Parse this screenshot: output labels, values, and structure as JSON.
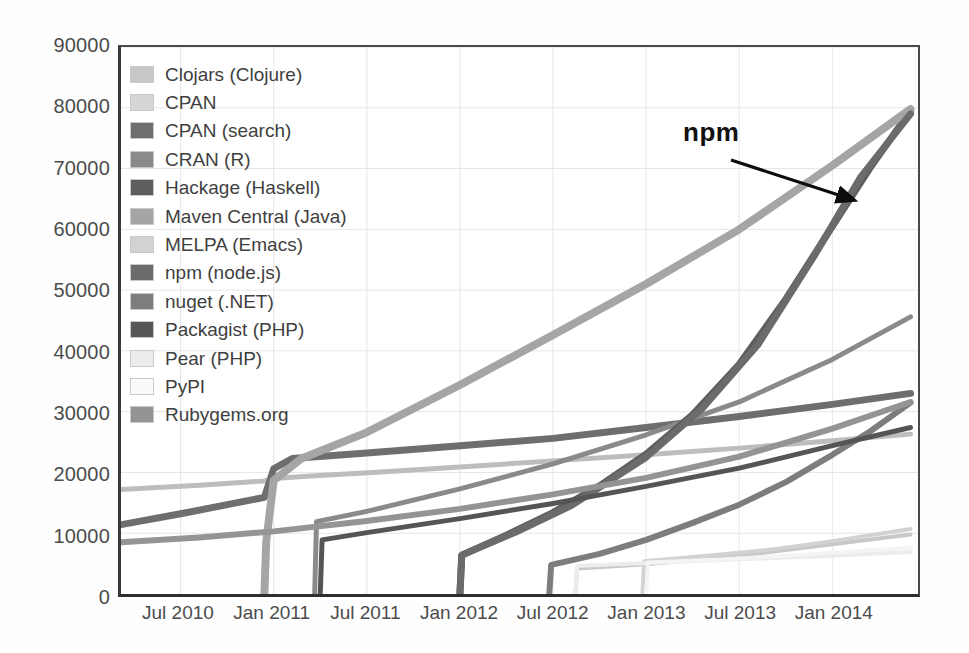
{
  "chart_data": {
    "type": "line",
    "title": "",
    "xlabel": "",
    "ylabel": "",
    "ylim": [
      0,
      90000
    ],
    "ytick_labels": [
      "90000",
      "80000",
      "70000",
      "60000",
      "50000",
      "40000",
      "30000",
      "20000",
      "10000",
      "0"
    ],
    "ytick_values": [
      90000,
      80000,
      70000,
      60000,
      50000,
      40000,
      30000,
      20000,
      10000,
      0
    ],
    "xtick_labels": [
      "Jul 2010",
      "Jan 2011",
      "Jul 2011",
      "Jan 2012",
      "Jul 2012",
      "Jan 2013",
      "Jul 2013",
      "Jan 2014"
    ],
    "xtick_values": [
      2010.5,
      2011.0,
      2011.5,
      2012.0,
      2012.5,
      2013.0,
      2013.5,
      2014.0
    ],
    "xlim": [
      2010.18,
      2014.46
    ],
    "grid": true,
    "grid_color": "#e6e6e6",
    "legend_position": "upper left",
    "annotations": [
      {
        "text": "npm",
        "x": 2013.38,
        "y": 73500,
        "arrow_to_x": 2014.13,
        "arrow_to_y": 65200
      }
    ],
    "series": [
      {
        "name": "Clojars (Clojure)",
        "color": "#c8c8c8",
        "width": 4,
        "points": [
          [
            2012.62,
            0
          ],
          [
            2012.63,
            4200
          ],
          [
            2013.0,
            4900
          ],
          [
            2013.5,
            6300
          ],
          [
            2014.0,
            8200
          ],
          [
            2014.42,
            9800
          ]
        ]
      },
      {
        "name": "CPAN",
        "color": "#bdbdbd",
        "width": 5,
        "points": [
          [
            2010.18,
            17200
          ],
          [
            2010.6,
            17900
          ],
          [
            2010.95,
            18600
          ],
          [
            2011.0,
            19000
          ],
          [
            2011.2,
            19400
          ],
          [
            2011.6,
            20100
          ],
          [
            2012.0,
            20900
          ],
          [
            2012.5,
            21900
          ],
          [
            2013.0,
            22900
          ],
          [
            2013.5,
            24000
          ],
          [
            2014.0,
            25200
          ],
          [
            2014.42,
            26300
          ]
        ]
      },
      {
        "name": "CPAN (search)",
        "color": "#6e6e6e",
        "width": 7,
        "points": [
          [
            2010.18,
            11400
          ],
          [
            2010.5,
            13200
          ],
          [
            2010.95,
            15900
          ],
          [
            2011.0,
            20600
          ],
          [
            2011.1,
            22300
          ],
          [
            2011.5,
            23200
          ],
          [
            2012.0,
            24400
          ],
          [
            2012.5,
            25600
          ],
          [
            2013.0,
            27400
          ],
          [
            2013.5,
            29200
          ],
          [
            2014.0,
            31200
          ],
          [
            2014.42,
            33000
          ]
        ]
      },
      {
        "name": "CRAN (R)",
        "color": "#8a8a8a",
        "width": 5,
        "points": [
          [
            2011.22,
            0
          ],
          [
            2011.23,
            11900
          ],
          [
            2011.5,
            13600
          ],
          [
            2012.0,
            17300
          ],
          [
            2012.5,
            21400
          ],
          [
            2013.0,
            26200
          ],
          [
            2013.5,
            31600
          ],
          [
            2014.0,
            38600
          ],
          [
            2014.42,
            45600
          ]
        ]
      },
      {
        "name": "Hackage (Haskell)",
        "color": "#5e5e5e",
        "width": 7,
        "points": [
          [
            2012.0,
            0
          ],
          [
            2012.01,
            6400
          ],
          [
            2012.25,
            9700
          ],
          [
            2012.5,
            13400
          ],
          [
            2012.75,
            17800
          ],
          [
            2013.0,
            23000
          ],
          [
            2013.25,
            29500
          ],
          [
            2013.5,
            37800
          ],
          [
            2013.75,
            48500
          ],
          [
            2014.0,
            60500
          ],
          [
            2014.2,
            70000
          ],
          [
            2014.42,
            79500
          ]
        ]
      },
      {
        "name": "Maven Central (Java)",
        "color": "#a5a5a5",
        "width": 8,
        "points": [
          [
            2010.95,
            0
          ],
          [
            2010.96,
            8700
          ],
          [
            2011.0,
            18700
          ],
          [
            2011.15,
            22300
          ],
          [
            2011.5,
            26600
          ],
          [
            2012.0,
            34400
          ],
          [
            2012.5,
            42600
          ],
          [
            2013.0,
            51000
          ],
          [
            2013.5,
            60000
          ],
          [
            2014.0,
            70500
          ],
          [
            2014.42,
            79800
          ]
        ]
      },
      {
        "name": "MELPA (Emacs)",
        "color": "#d2d2d2",
        "width": 4,
        "points": [
          [
            2012.98,
            0
          ],
          [
            2012.99,
            5400
          ],
          [
            2013.3,
            6200
          ],
          [
            2013.7,
            7400
          ],
          [
            2014.0,
            8700
          ],
          [
            2014.42,
            10700
          ]
        ]
      },
      {
        "name": "npm (node.js)",
        "color": "#6b6b6b",
        "width": 7,
        "points": [
          [
            2012.0,
            0
          ],
          [
            2012.01,
            6400
          ],
          [
            2012.3,
            10200
          ],
          [
            2012.6,
            14600
          ],
          [
            2013.0,
            22500
          ],
          [
            2013.3,
            30500
          ],
          [
            2013.6,
            41000
          ],
          [
            2013.9,
            55500
          ],
          [
            2014.15,
            68500
          ],
          [
            2014.42,
            79000
          ]
        ]
      },
      {
        "name": "nuget (.NET)",
        "color": "#7d7d7d",
        "width": 6,
        "points": [
          [
            2012.48,
            0
          ],
          [
            2012.49,
            4800
          ],
          [
            2012.75,
            6600
          ],
          [
            2013.0,
            8900
          ],
          [
            2013.25,
            11700
          ],
          [
            2013.5,
            14700
          ],
          [
            2013.75,
            18400
          ],
          [
            2014.0,
            22900
          ],
          [
            2014.2,
            26700
          ],
          [
            2014.42,
            31500
          ]
        ]
      },
      {
        "name": "Packagist (PHP)",
        "color": "#555555",
        "width": 5,
        "points": [
          [
            2011.25,
            0
          ],
          [
            2011.26,
            8900
          ],
          [
            2011.5,
            10100
          ],
          [
            2012.0,
            12400
          ],
          [
            2012.5,
            14900
          ],
          [
            2013.0,
            17700
          ],
          [
            2013.5,
            20700
          ],
          [
            2014.0,
            24400
          ],
          [
            2014.42,
            27400
          ]
        ]
      },
      {
        "name": "Pear (PHP)",
        "color": "#ececec",
        "width": 4,
        "points": [
          [
            2012.62,
            0
          ],
          [
            2012.63,
            4600
          ],
          [
            2013.0,
            5100
          ],
          [
            2013.5,
            5700
          ],
          [
            2014.0,
            6300
          ],
          [
            2014.42,
            6900
          ]
        ]
      },
      {
        "name": "PyPI",
        "color": "#f4f4f4",
        "width": 4,
        "points": [
          [
            2013.0,
            0
          ],
          [
            2013.01,
            5200
          ],
          [
            2013.4,
            5700
          ],
          [
            2013.8,
            6400
          ],
          [
            2014.1,
            7000
          ],
          [
            2014.42,
            7600
          ]
        ]
      },
      {
        "name": "Rubygems.org",
        "color": "#949494",
        "width": 6,
        "points": [
          [
            2010.18,
            8500
          ],
          [
            2010.6,
            9300
          ],
          [
            2011.0,
            10300
          ],
          [
            2011.5,
            12000
          ],
          [
            2012.0,
            14000
          ],
          [
            2012.5,
            16400
          ],
          [
            2013.0,
            19100
          ],
          [
            2013.5,
            22600
          ],
          [
            2014.0,
            27200
          ],
          [
            2014.42,
            31600
          ]
        ]
      }
    ]
  },
  "legend": {
    "items": [
      {
        "label": "Clojars (Clojure)",
        "color": "#c8c8c8"
      },
      {
        "label": "CPAN",
        "color": "#d6d6d6"
      },
      {
        "label": "CPAN (search)",
        "color": "#6e6e6e"
      },
      {
        "label": "CRAN (R)",
        "color": "#8a8a8a"
      },
      {
        "label": "Hackage (Haskell)",
        "color": "#5e5e5e"
      },
      {
        "label": "Maven Central (Java)",
        "color": "#a5a5a5"
      },
      {
        "label": "MELPA (Emacs)",
        "color": "#d2d2d2"
      },
      {
        "label": "npm (node.js)",
        "color": "#6b6b6b"
      },
      {
        "label": "nuget (.NET)",
        "color": "#7d7d7d"
      },
      {
        "label": "Packagist (PHP)",
        "color": "#555555"
      },
      {
        "label": "Pear (PHP)",
        "color": "#ececec"
      },
      {
        "label": "PyPI",
        "color": "#fafafa"
      },
      {
        "label": "Rubygems.org",
        "color": "#949494"
      }
    ]
  },
  "annotation": {
    "npm_label": "npm"
  }
}
